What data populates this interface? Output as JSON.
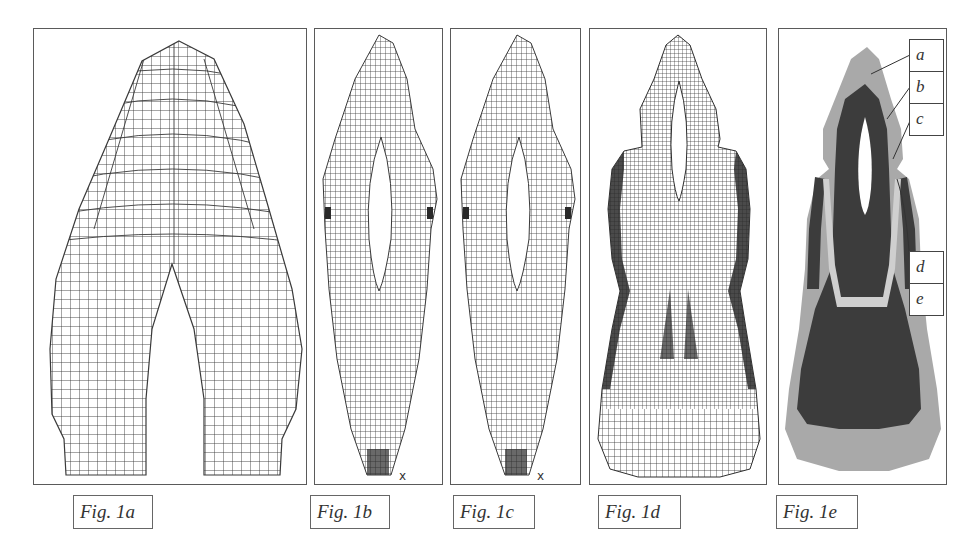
{
  "figure": {
    "panels": [
      {
        "id": "1a",
        "caption": "Fig. 1a",
        "description": "Coarse finite-element mesh of tooth crown with bifurcated roots"
      },
      {
        "id": "1b",
        "caption": "Fig. 1b",
        "description": "Fine finite-element mesh with pulp cavity",
        "axis_label": "x"
      },
      {
        "id": "1c",
        "caption": "Fig. 1c",
        "description": "Fine finite-element mesh with pulp cavity (variant)",
        "axis_label": "x"
      },
      {
        "id": "1d",
        "caption": "Fig. 1d",
        "description": "Dense mesh including surrounding bone layers"
      },
      {
        "id": "1e",
        "caption": "Fig. 1e",
        "description": "Material regions map"
      }
    ],
    "material_labels": [
      "a",
      "b",
      "c",
      "d",
      "e"
    ],
    "colors": {
      "mesh_line": "#3a3a3a",
      "border": "#5a5a5a",
      "region_light": "#a9a9a9",
      "region_dark": "#3c3c3c",
      "region_pale": "#cfcfcf"
    }
  }
}
